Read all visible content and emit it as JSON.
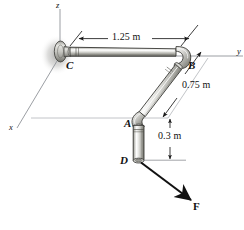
{
  "figure": {
    "axes": [
      {
        "name": "z-axis-label",
        "label": "z"
      },
      {
        "name": "y-axis-label",
        "label": "y"
      },
      {
        "name": "x-axis-label",
        "label": "x"
      }
    ],
    "points": [
      {
        "name": "point-c",
        "label": "C"
      },
      {
        "name": "point-b",
        "label": "B"
      },
      {
        "name": "point-a",
        "label": "A"
      },
      {
        "name": "point-d",
        "label": "D"
      }
    ],
    "dimensions": [
      {
        "name": "dimension-cb",
        "label": "1.25 m"
      },
      {
        "name": "dimension-ba",
        "label": "0.75 m"
      },
      {
        "name": "dimension-ad",
        "label": "0.3 m"
      }
    ],
    "force": {
      "name": "force-label",
      "label": "F"
    },
    "colors": {
      "line": "#1a1a1a",
      "axis": "#8a8d93",
      "pipe_light": "#f2f2f0",
      "pipe_mid": "#b9b9b6",
      "pipe_dark": "#77776f",
      "pipe_outline": "#2b2b2b",
      "shadow": "#c9c9c7",
      "text": "#111111"
    }
  }
}
